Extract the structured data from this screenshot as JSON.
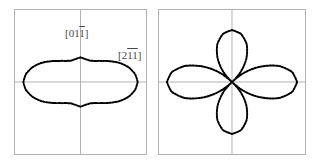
{
  "figure": {
    "background_color": "#ffffff",
    "frame_color": "#b0b0b0",
    "axis_color": "#a8a8a8",
    "curve_color": "#000000",
    "label_color": "#4a4a4a"
  },
  "panels": [
    {
      "id": "left",
      "labels": {
        "vertical_axis": {
          "prefix": "[01",
          "overbar": "1",
          "suffix": "]"
        },
        "horizontal_axis": {
          "prefix": "[2",
          "overbar": "11",
          "suffix": "]"
        }
      }
    },
    {
      "id": "right",
      "labels": {
        "vertical_axis": {
          "prefix": "[01",
          "overbar": "1",
          "suffix": "]"
        },
        "horizontal_axis": {
          "prefix": "[2",
          "overbar": "11",
          "suffix": "]"
        }
      }
    }
  ],
  "chart_data": [
    {
      "type": "line",
      "plot_style": "polar",
      "id": "left-polar-plot",
      "title": "",
      "xlabel": "[211̅]",
      "ylabel": "[011̅]",
      "legend": [],
      "grid": true,
      "axes": {
        "horizontal_at_angle_deg": 0,
        "vertical_at_angle_deg": 90
      },
      "description": "Weakly four-fold anisotropic polar plot: broad horizontal lobes along [2-1-1] with small vertical bumps along [01-1]; curve never reaches the origin.",
      "r_units": "arbitrary",
      "rmax": 1.0,
      "theta_deg": [
        0,
        10,
        20,
        30,
        40,
        50,
        60,
        70,
        80,
        90,
        100,
        110,
        120,
        130,
        140,
        150,
        160,
        170,
        180,
        190,
        200,
        210,
        220,
        230,
        240,
        250,
        260,
        270,
        280,
        290,
        300,
        310,
        320,
        330,
        340,
        350,
        360
      ],
      "r": [
        1.0,
        0.97,
        0.9,
        0.8,
        0.68,
        0.58,
        0.51,
        0.48,
        0.49,
        0.52,
        0.49,
        0.48,
        0.51,
        0.58,
        0.68,
        0.8,
        0.9,
        0.97,
        1.0,
        0.97,
        0.9,
        0.8,
        0.68,
        0.58,
        0.51,
        0.48,
        0.49,
        0.52,
        0.49,
        0.48,
        0.51,
        0.58,
        0.68,
        0.8,
        0.9,
        0.97,
        1.0
      ]
    },
    {
      "type": "line",
      "plot_style": "polar",
      "id": "right-polar-plot",
      "title": "",
      "xlabel": "[211̅]",
      "ylabel": "[011̅]",
      "legend": [],
      "grid": true,
      "axes": {
        "horizontal_at_angle_deg": 0,
        "vertical_at_angle_deg": 90
      },
      "description": "Strongly four-fold anisotropic four-petal rose: petals along the horizontal [2-1-1] and vertical [01-1] axes, vanishing to zero at the 45 degree diagonals.",
      "r_units": "arbitrary",
      "rmax": 1.0,
      "theta_deg": [
        0,
        10,
        20,
        30,
        40,
        45,
        50,
        60,
        70,
        80,
        90,
        100,
        110,
        120,
        130,
        135,
        140,
        150,
        160,
        170,
        180,
        190,
        200,
        210,
        220,
        225,
        230,
        240,
        250,
        260,
        270,
        280,
        290,
        300,
        310,
        315,
        320,
        330,
        340,
        350,
        360
      ],
      "r": [
        1.0,
        0.94,
        0.77,
        0.5,
        0.21,
        0.0,
        0.18,
        0.44,
        0.66,
        0.8,
        0.85,
        0.8,
        0.66,
        0.44,
        0.18,
        0.0,
        0.21,
        0.5,
        0.77,
        0.94,
        1.0,
        0.94,
        0.77,
        0.5,
        0.21,
        0.0,
        0.18,
        0.44,
        0.66,
        0.8,
        0.85,
        0.8,
        0.66,
        0.44,
        0.18,
        0.0,
        0.21,
        0.5,
        0.77,
        0.94,
        1.0
      ]
    }
  ]
}
